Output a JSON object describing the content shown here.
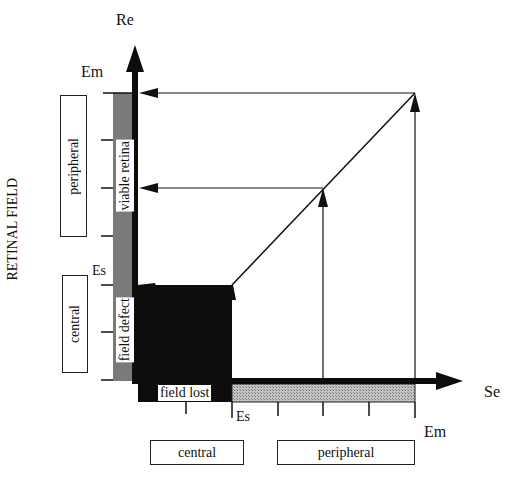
{
  "diagram": {
    "y_axis": {
      "label": "Re",
      "max_label": "Em",
      "threshold_label": "Es",
      "title": "RETINAL FIELD"
    },
    "x_axis": {
      "label": "Se",
      "max_label": "Em",
      "threshold_label": "Es"
    },
    "retinal_field_boxes": [
      {
        "label": "peripheral"
      },
      {
        "label": "central"
      }
    ],
    "stimulus_field_boxes": [
      {
        "label": "central"
      },
      {
        "label": "peripheral"
      }
    ],
    "band_labels": {
      "viable": "viable retina",
      "defect": "field defect",
      "lost": "field lost"
    },
    "colors": {
      "ink": "#111111",
      "gray_band": "#7a7a7a",
      "hatched_band": "#b5b5b5",
      "field_lost_fill": "#0d0d0d"
    }
  }
}
